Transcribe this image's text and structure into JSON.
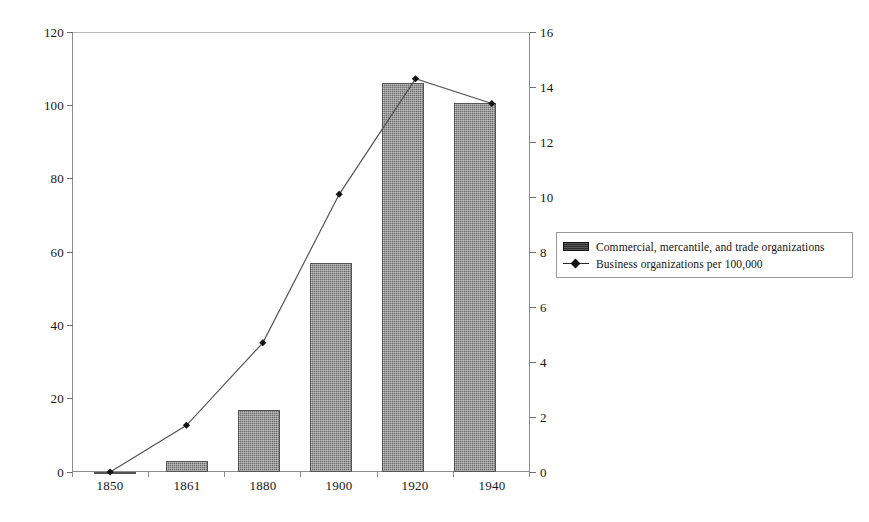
{
  "chart_data": {
    "type": "bar",
    "title": "",
    "subtitle": "",
    "xlabel": "",
    "ylabel": "",
    "categories": [
      "1850",
      "1861",
      "1880",
      "1900",
      "1920",
      "1940"
    ],
    "grid": false,
    "legend_position": "right",
    "axes": {
      "left": {
        "label": "",
        "ticks": [
          "0",
          "20",
          "40",
          "60",
          "80",
          "100",
          "120"
        ],
        "tick_values": [
          0,
          20,
          40,
          60,
          80,
          100,
          120
        ],
        "min": 0,
        "max": 120
      },
      "right": {
        "label": "",
        "ticks": [
          "0",
          "2",
          "4",
          "6",
          "8",
          "10",
          "12",
          "14",
          "16"
        ],
        "tick_values": [
          0,
          2,
          4,
          6,
          8,
          10,
          12,
          14,
          16
        ],
        "min": 0,
        "max": 16
      }
    },
    "series": [
      {
        "name": "Commercial, mercantile, and trade organizations",
        "type": "bar",
        "axis": "left",
        "color": "#6e6e6e",
        "values": [
          0,
          3,
          17,
          57,
          106,
          101
        ]
      },
      {
        "name": "Business organizations per 100,000",
        "type": "line",
        "axis": "right",
        "color": "#2b2b2b",
        "marker": "diamond",
        "values": [
          0.0,
          1.7,
          4.7,
          10.1,
          14.3,
          13.4
        ]
      }
    ]
  },
  "legend": {
    "items": [
      {
        "label": "Commercial, mercantile, and trade organizations",
        "swatch": "bar-swatch"
      },
      {
        "label": "Business organizations per 100,000",
        "swatch": "line-marker-swatch"
      }
    ]
  },
  "y_left_ticks": [
    "120",
    "100",
    "80",
    "60",
    "40",
    "20",
    "0"
  ],
  "y_right_ticks": [
    "16",
    "14",
    "12",
    "10",
    "8",
    "6",
    "4",
    "2",
    "0"
  ],
  "x_ticks": [
    "1850",
    "1861",
    "1880",
    "1900",
    "1920",
    "1940"
  ]
}
